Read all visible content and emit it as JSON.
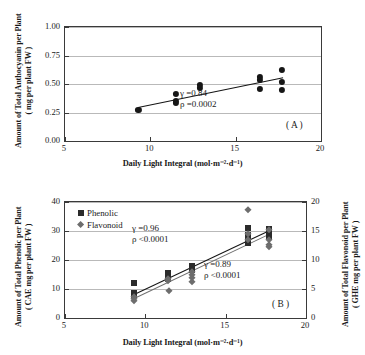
{
  "figure": {
    "xlabel_main": "Daily Light Integral (mol",
    "xlabel_unit_mid": "m",
    "xlabel_unit_tail": "d",
    "xlabel_close": ")"
  },
  "panel_a": {
    "tag": "( A )",
    "ytitle_line1": "Amount of Total Anthocyanin per Plant",
    "ytitle_line2": "( mg per plant FW )",
    "xtitle": "Daily Light Integral (mol·m⁻²·d⁻¹)",
    "yticks": [
      "0.00",
      "0.25",
      "0.50",
      "0.75",
      "1.00"
    ],
    "xticks": [
      "5",
      "10",
      "15",
      "20"
    ],
    "annotation_r": "γ =0.84",
    "annotation_p": "ρ =0.0002"
  },
  "panel_b": {
    "tag": "( B )",
    "ytitle_left_line1": "Amount of Total Phenolic per Plant",
    "ytitle_left_line2": "( CAE mg per plant FW )",
    "ytitle_right_line1": "Amount of Total Flavonoid per Plant",
    "ytitle_right_line2": "( GHE mg per plant FW )",
    "xtitle": "Daily Light Integral (mol·m⁻²·d⁻¹)",
    "yticks_left": [
      "0",
      "10",
      "20",
      "30",
      "40"
    ],
    "yticks_right": [
      "0",
      "5",
      "10",
      "15",
      "20"
    ],
    "xticks": [
      "5",
      "10",
      "15",
      "20"
    ],
    "legend": [
      {
        "label": "Phenolic",
        "marker": "square-marker",
        "color": "#2b2b2b"
      },
      {
        "label": "Flavonoid",
        "marker": "diamond-marker",
        "color": "#6d6d6d"
      }
    ],
    "annotation_phenolic_r": "γ =0.96",
    "annotation_phenolic_p": "ρ <0.0001",
    "annotation_flavonoid_r": "γ =0.89",
    "annotation_flavonoid_p": "ρ <0.0001"
  },
  "chart_data": [
    {
      "type": "scatter",
      "panel": "A",
      "title": "",
      "xlabel": "Daily Light Integral (mol·m⁻²·d⁻¹)",
      "ylabel": "Amount of Total Anthocyanin per Plant ( mg per plant FW )",
      "xlim": [
        5,
        20
      ],
      "ylim": [
        0.0,
        1.0
      ],
      "xticks": [
        5,
        10,
        15,
        20
      ],
      "yticks": [
        0.0,
        0.25,
        0.5,
        0.75,
        1.0
      ],
      "grid": "horizontal",
      "legend_position": "none",
      "marker": "filled-circle",
      "series": [
        {
          "name": "Total anthocyanin",
          "points": [
            [
              9.3,
              0.275
            ],
            [
              11.5,
              0.415
            ],
            [
              11.5,
              0.355
            ],
            [
              11.5,
              0.335
            ],
            [
              12.9,
              0.465
            ],
            [
              12.9,
              0.495
            ],
            [
              16.4,
              0.565
            ],
            [
              16.4,
              0.535
            ],
            [
              16.4,
              0.455
            ],
            [
              17.7,
              0.625
            ],
            [
              17.7,
              0.515
            ],
            [
              17.7,
              0.45
            ]
          ]
        }
      ],
      "fit_line": {
        "x": [
          9.3,
          17.8
        ],
        "y": [
          0.295,
          0.555
        ]
      },
      "annotations": [
        "γ =0.84",
        "ρ =0.0002",
        "( A )"
      ]
    },
    {
      "type": "scatter",
      "panel": "B",
      "title": "",
      "xlabel": "Daily Light Integral (mol·m⁻²·d⁻¹)",
      "ylabel": "Amount of Total Phenolic per Plant ( CAE mg per plant FW )",
      "ylabel_secondary": "Amount of Total Flavonoid per Plant ( GHE mg per plant FW )",
      "xlim": [
        5,
        20
      ],
      "ylim": [
        0,
        40
      ],
      "ylim_secondary": [
        0,
        20
      ],
      "xticks": [
        5,
        10,
        15,
        20
      ],
      "yticks": [
        0,
        10,
        20,
        30,
        40
      ],
      "yticks_secondary": [
        0,
        5,
        10,
        15,
        20
      ],
      "grid": "horizontal",
      "legend_position": "top-left",
      "series": [
        {
          "name": "Phenolic",
          "axis": "left",
          "marker": "filled-square",
          "color": "#2b2b2b",
          "points": [
            [
              9.3,
              12.0
            ],
            [
              9.3,
              8.6
            ],
            [
              9.3,
              7.8
            ],
            [
              11.4,
              15.4
            ],
            [
              11.4,
              14.0
            ],
            [
              11.4,
              13.3
            ],
            [
              12.9,
              18.0
            ],
            [
              12.9,
              17.2
            ],
            [
              12.9,
              16.6
            ],
            [
              16.4,
              31.2
            ],
            [
              16.4,
              28.6
            ],
            [
              16.4,
              26.8
            ],
            [
              16.4,
              25.7
            ],
            [
              17.7,
              30.6
            ],
            [
              17.7,
              29.4
            ],
            [
              17.7,
              28.0
            ]
          ]
        },
        {
          "name": "Flavonoid",
          "axis": "right",
          "marker": "filled-diamond",
          "color": "#6d6d6d",
          "points": [
            [
              9.3,
              3.6
            ],
            [
              9.3,
              3.2
            ],
            [
              9.3,
              2.9
            ],
            [
              11.4,
              6.8
            ],
            [
              11.4,
              6.4
            ],
            [
              11.5,
              4.6
            ],
            [
              12.9,
              8.0
            ],
            [
              12.9,
              7.4
            ],
            [
              12.9,
              6.9
            ],
            [
              12.9,
              6.2
            ],
            [
              16.4,
              18.6
            ],
            [
              16.4,
              14.4
            ],
            [
              16.4,
              13.4
            ],
            [
              17.7,
              15.2
            ],
            [
              17.7,
              13.4
            ],
            [
              17.7,
              12.6
            ],
            [
              17.7,
              12.2
            ]
          ]
        }
      ],
      "fit_lines": [
        {
          "name": "Phenolic",
          "axis": "left",
          "x": [
            9.3,
            17.8
          ],
          "y": [
            8.4,
            30.6
          ]
        },
        {
          "name": "Flavonoid",
          "axis": "right",
          "x": [
            9.3,
            17.8
          ],
          "y": [
            3.4,
            14.6
          ]
        }
      ],
      "annotations": [
        "γ =0.96",
        "ρ <0.0001",
        "γ =0.89",
        "ρ <0.0001",
        "( B )"
      ]
    }
  ]
}
